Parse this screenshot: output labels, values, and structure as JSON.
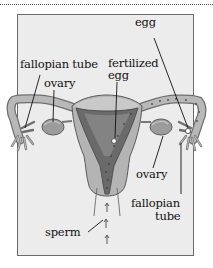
{
  "diagram": {
    "labels": {
      "egg": "egg",
      "fallopian_tube_left": "fallopian tube",
      "ovary_left": "ovary",
      "fertilized_egg_line1": "fertilized",
      "fertilized_egg_line2": "egg",
      "ovary_right": "ovary",
      "fallopian_tube_right_line1": "fallopian",
      "fallopian_tube_right_line2": "tube",
      "sperm": "sperm"
    },
    "colors": {
      "panel_bg": "#ececec",
      "panel_border": "#6a6a6a",
      "tissue_light": "#b4b4b4",
      "tissue_mid": "#8c8c8c",
      "tissue_dark": "#5a5a5a",
      "ink": "#111111"
    }
  }
}
